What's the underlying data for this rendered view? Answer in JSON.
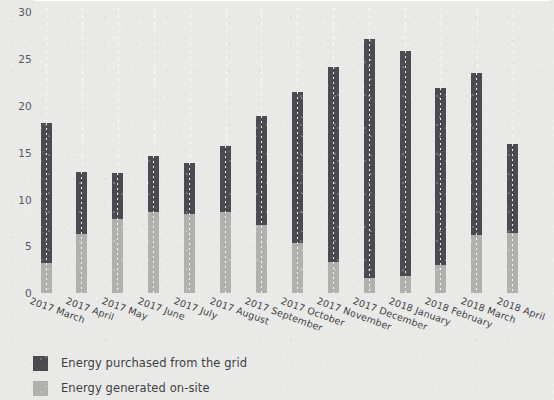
{
  "chart_data": {
    "type": "bar",
    "stacked": true,
    "title": "",
    "xlabel": "",
    "ylabel": "",
    "ylim": [
      0,
      30
    ],
    "yticks": [
      0,
      5,
      10,
      15,
      20,
      25,
      30
    ],
    "grid": "vertical-dotted",
    "legend_position": "bottom-left",
    "categories": [
      "2017 March",
      "2017 April",
      "2017 May",
      "2017 June",
      "2017 July",
      "2017 August",
      "2017 September",
      "2017 October",
      "2017 November",
      "2017 December",
      "2018 January",
      "2018 February",
      "2018 March",
      "2018 April"
    ],
    "series": [
      {
        "name": "Energy generated on-site",
        "color": "#b0b0ae",
        "values": [
          3.3,
          6.4,
          7.9,
          8.7,
          8.5,
          8.7,
          7.3,
          5.4,
          3.4,
          1.7,
          1.9,
          3.0,
          6.2,
          6.5
        ]
      },
      {
        "name": "Energy purchased from the grid",
        "color": "#4a4a50",
        "values": [
          14.9,
          6.6,
          5.0,
          6.0,
          5.4,
          7.0,
          11.7,
          16.1,
          20.8,
          25.5,
          24.0,
          18.9,
          17.3,
          9.5
        ]
      }
    ],
    "totals": [
      18.2,
      13.0,
      12.9,
      14.7,
      13.9,
      15.7,
      19.0,
      21.5,
      24.2,
      27.2,
      25.9,
      21.9,
      23.5,
      16.0
    ]
  },
  "legend": {
    "items": [
      {
        "label": "Energy purchased from the grid",
        "swatch": "dark"
      },
      {
        "label": "Energy generated on-site",
        "swatch": "light"
      }
    ]
  },
  "colors": {
    "background": "#e9e9e7",
    "purchased": "#4a4a50",
    "generated": "#b0b0ae",
    "gridline": "#ffffff",
    "text": "#3d3d42"
  }
}
